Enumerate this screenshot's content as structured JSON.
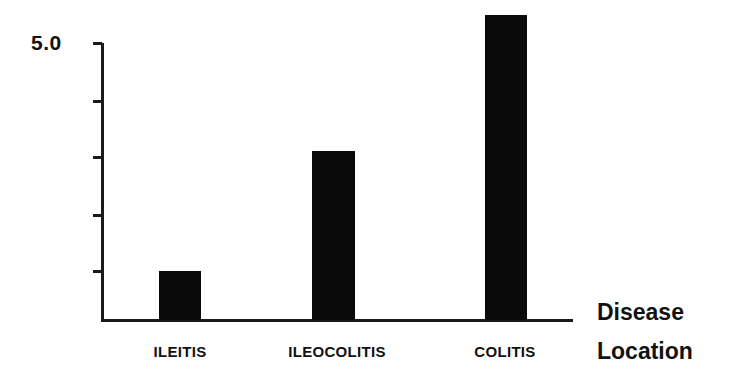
{
  "chart_data": {
    "type": "bar",
    "title": "",
    "xlabel": "Disease Location",
    "xlabel_lines": [
      "Disease",
      "Location"
    ],
    "ylabel": "",
    "categories": [
      "ILEITIS",
      "ILEOCOLITIS",
      "COLITIS"
    ],
    "values": [
      1.0,
      3.1,
      5.5
    ],
    "ylim": [
      0,
      5.0
    ],
    "yticks": [
      1.0,
      2.0,
      3.0,
      4.0,
      5.0
    ],
    "ytick_labels_visible": [
      "5.0"
    ],
    "grid": false,
    "legend": null,
    "bar_color": "#0a0a0a"
  }
}
